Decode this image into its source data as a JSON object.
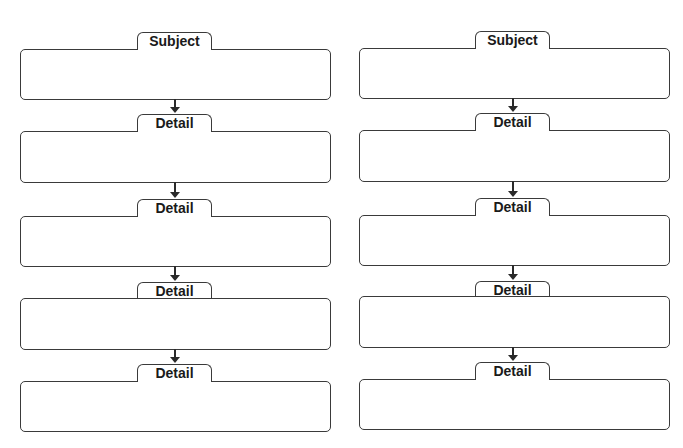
{
  "diagram": {
    "type": "flowchart-organizer",
    "columns": [
      {
        "id": "left",
        "x": 20,
        "width": 311,
        "label_x": 137,
        "label_width": 75,
        "arrow_x": 170,
        "rows": [
          {
            "label": "Subject",
            "label_top": 32,
            "box_top": 49,
            "box_height": 51
          },
          {
            "label": "Detail",
            "label_top": 114,
            "box_top": 131,
            "box_height": 52
          },
          {
            "label": "Detail",
            "label_top": 199,
            "box_top": 216,
            "box_height": 51
          },
          {
            "label": "Detail",
            "label_top": 282,
            "box_top": 298,
            "box_height": 52
          },
          {
            "label": "Detail",
            "label_top": 364,
            "box_top": 381,
            "box_height": 51
          }
        ]
      },
      {
        "id": "right",
        "x": 359,
        "width": 311,
        "label_x": 475,
        "label_width": 75,
        "arrow_x": 508,
        "rows": [
          {
            "label": "Subject",
            "label_top": 31,
            "box_top": 48,
            "box_height": 51
          },
          {
            "label": "Detail",
            "label_top": 113,
            "box_top": 130,
            "box_height": 52
          },
          {
            "label": "Detail",
            "label_top": 198,
            "box_top": 215,
            "box_height": 51
          },
          {
            "label": "Detail",
            "label_top": 281,
            "box_top": 296,
            "box_height": 52
          },
          {
            "label": "Detail",
            "label_top": 362,
            "box_top": 379,
            "box_height": 51
          }
        ]
      }
    ],
    "colors": {
      "stroke": "#3a3a3a",
      "text": "#1a1a1a",
      "background": "#ffffff"
    }
  }
}
